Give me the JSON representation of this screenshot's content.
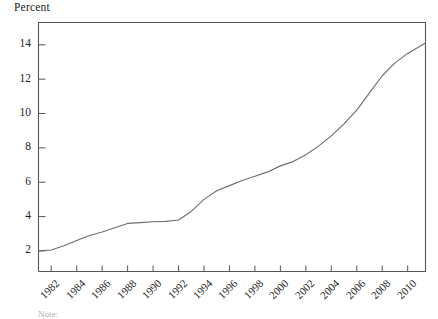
{
  "figure": {
    "axis_title": "Percent",
    "note_text": "Note:",
    "line_color": "#6e6e6e",
    "axis_color": "#555555",
    "text_color": "#232323",
    "background": "#ffffff"
  },
  "chart_data": {
    "type": "line",
    "title": "",
    "subtitle": "",
    "xlabel": "",
    "ylabel": "Percent",
    "ylim": [
      0.8,
      15.3
    ],
    "xlim": [
      1981,
      2011.4
    ],
    "grid": false,
    "legend": null,
    "y_ticks": [
      2,
      4,
      6,
      8,
      10,
      12,
      14
    ],
    "y_tick_labels": [
      "2",
      "4",
      "6",
      "8",
      "10",
      "12",
      "14"
    ],
    "x_ticks": [
      1982,
      1984,
      1986,
      1988,
      1990,
      1992,
      1994,
      1996,
      1998,
      2000,
      2002,
      2004,
      2006,
      2008,
      2010
    ],
    "x_tick_labels": [
      "1982",
      "1984",
      "1986",
      "1988",
      "1990",
      "1992",
      "1994",
      "1996",
      "1998",
      "2000",
      "2002",
      "2004",
      "2006",
      "2008",
      "2010"
    ],
    "series": [
      {
        "name": "Percent",
        "x": [
          1981,
          1982,
          1983,
          1984,
          1985,
          1986,
          1987,
          1988,
          1989,
          1990,
          1991,
          1992,
          1993,
          1994,
          1995,
          1996,
          1997,
          1998,
          1999,
          2000,
          2001,
          2002,
          2003,
          2004,
          2005,
          2006,
          2007,
          2008,
          2009,
          2010,
          2011.4
        ],
        "values": [
          2.0,
          2.05,
          2.3,
          2.6,
          2.9,
          3.1,
          3.35,
          3.6,
          3.65,
          3.7,
          3.72,
          3.8,
          4.3,
          5.0,
          5.5,
          5.8,
          6.1,
          6.35,
          6.6,
          6.95,
          7.2,
          7.6,
          8.1,
          8.7,
          9.4,
          10.2,
          11.2,
          12.2,
          12.95,
          13.5,
          14.1
        ]
      }
    ]
  }
}
